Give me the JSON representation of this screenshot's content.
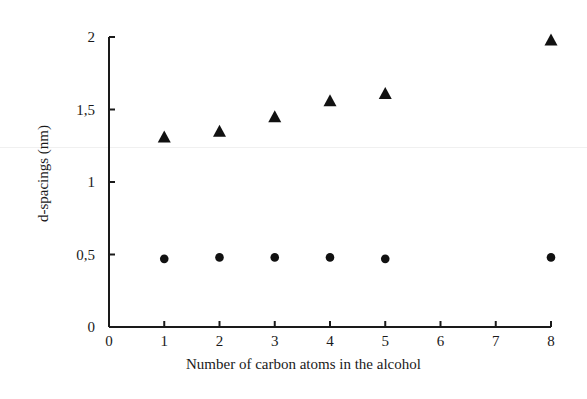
{
  "chart_data": {
    "type": "scatter",
    "title": "",
    "xlabel": "Number of carbon atoms in the alcohol",
    "ylabel": "d-spacings (nm)",
    "xlim": [
      0,
      8
    ],
    "ylim": [
      0,
      2
    ],
    "x_ticks": [
      "0",
      "1",
      "2",
      "3",
      "4",
      "5",
      "6",
      "7",
      "8"
    ],
    "y_ticks": [
      "0",
      "0,5",
      "1",
      "1,5",
      "2"
    ],
    "y_tick_values": [
      0,
      0.5,
      1,
      1.5,
      2
    ],
    "grid": false,
    "legend": null,
    "series": [
      {
        "name": "triangles",
        "marker": "triangle",
        "x": [
          1,
          2,
          3,
          4,
          5,
          8
        ],
        "values": [
          1.31,
          1.35,
          1.45,
          1.56,
          1.61,
          1.98
        ]
      },
      {
        "name": "circles",
        "marker": "circle",
        "x": [
          1,
          2,
          3,
          4,
          5,
          8
        ],
        "values": [
          0.47,
          0.48,
          0.48,
          0.48,
          0.47,
          0.48
        ]
      }
    ]
  },
  "axes": {
    "xlabel": "Number of carbon atoms in the alcohol",
    "ylabel": "d-spacings (nm)"
  },
  "colors": {
    "marker": "#111111",
    "axis": "#1a1a1a"
  }
}
